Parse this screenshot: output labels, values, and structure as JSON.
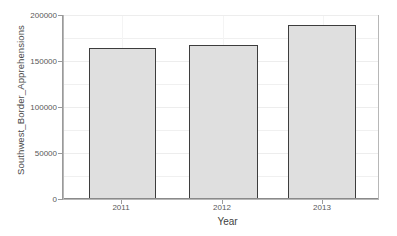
{
  "chart_data": {
    "type": "bar",
    "title": "",
    "subtitle": "",
    "xlabel": "Year",
    "ylabel": "Southwest_Border_Apprehensions",
    "categories": [
      "2011",
      "2012",
      "2013"
    ],
    "values": [
      166500,
      169000,
      191000
    ],
    "series": [
      {
        "name": "Southwest_Border_Apprehensions",
        "values": [
          166500,
          169000,
          191000
        ]
      }
    ],
    "ylim": [
      0,
      200000
    ],
    "ytick_labels": [
      "0",
      "50000",
      "100000",
      "150000",
      "200000"
    ],
    "ytick_values": [
      0,
      50000,
      100000,
      150000,
      200000
    ],
    "xtick_labels": [
      "2011",
      "2012",
      "2013"
    ],
    "grid": true,
    "legend": "none",
    "bar_fill_color": "#dfdfdf",
    "bar_border_color": "#3d3d3d",
    "panel_background": "#ffffff",
    "panel_border_color": "#b7b7b7",
    "gridline_color": "#ededed",
    "axis_color": "#9a9a9a",
    "text_color": "#4d4d4d"
  },
  "axes": {
    "y_title": "Southwest_Border_Apprehensions",
    "x_title": "Year"
  },
  "ticks": {
    "y": [
      {
        "label": "200000",
        "value": 200000
      },
      {
        "label": "150000",
        "value": 150000
      },
      {
        "label": "100000",
        "value": 100000
      },
      {
        "label": "50000",
        "value": 50000
      },
      {
        "label": "0",
        "value": 0
      }
    ],
    "x": [
      {
        "label": "2011"
      },
      {
        "label": "2012"
      },
      {
        "label": "2013"
      }
    ]
  }
}
